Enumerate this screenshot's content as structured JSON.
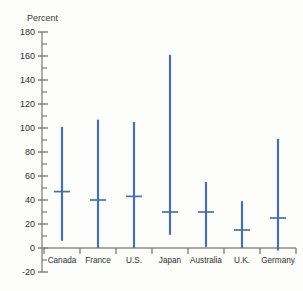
{
  "chart_data": {
    "type": "bar",
    "chart_style": "range-bars-with-median",
    "title": "",
    "subtitle": "",
    "xlabel": "",
    "ylabel": "Percent",
    "categories": [
      "Canada",
      "France",
      "U.S.",
      "Japan",
      "Australia",
      "U.K.",
      "Germany"
    ],
    "series": [
      {
        "name": "high",
        "values": [
          101,
          107,
          105,
          161,
          55,
          39,
          91
        ]
      },
      {
        "name": "median",
        "values": [
          47,
          40,
          43,
          30,
          30,
          15,
          25
        ]
      },
      {
        "name": "low",
        "values": [
          6,
          0,
          0,
          11,
          1,
          0,
          -2
        ]
      }
    ],
    "ylim": [
      -20,
      180
    ],
    "ytick_labels": [
      "180",
      "160",
      "140",
      "120",
      "100",
      "80",
      "60",
      "40",
      "20",
      "0",
      "-20"
    ],
    "ytick_values": [
      180,
      160,
      140,
      120,
      100,
      80,
      60,
      40,
      20,
      0,
      -20
    ],
    "yminor_step": 10,
    "grid": false,
    "legend": "none",
    "annotations": []
  },
  "style": {
    "bar_color": "#4a6fa8",
    "axis_color": "#8c8c8c",
    "text_color": "#2f2f2f",
    "background": "#fdfdfb"
  }
}
